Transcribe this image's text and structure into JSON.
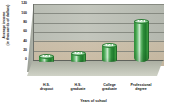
{
  "chart_data": {
    "type": "bar",
    "title": "",
    "subtitle": "",
    "xlabel": "Years of school",
    "ylabel": "Average income (in thousands of dollars)",
    "ylabel_line1": "Average income",
    "ylabel_line2": "(in thousands of dollars)",
    "categories": [
      "H.S. dropout",
      "H.S. graduate",
      "College graduate",
      "Professional degree"
    ],
    "category_lines": [
      [
        "H.S.",
        "dropout"
      ],
      [
        "H.S.",
        "graduate"
      ],
      [
        "College",
        "graduate"
      ],
      [
        "Professional",
        "degree"
      ]
    ],
    "values": [
      12,
      18,
      35,
      87
    ],
    "ylim": [
      0,
      120
    ],
    "yticks": [
      0,
      20,
      40,
      60,
      80,
      100,
      120
    ],
    "ytick_labels": [
      "0",
      "20",
      "40",
      "60",
      "80",
      "100",
      "120"
    ],
    "grid": true,
    "legend": "none",
    "style": "3d-cylinder",
    "bar_color": "#3a9a44",
    "plot_background": "#bcc0b7",
    "floor_color": "#c3c6bb",
    "gridline_color": "#7e8179"
  }
}
